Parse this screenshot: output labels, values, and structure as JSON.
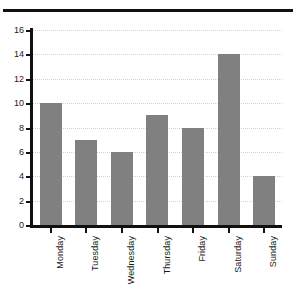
{
  "chart_data": {
    "type": "bar",
    "title": "",
    "title_note": "title row is cropped off the top edge of the screenshot and is not legible",
    "categories": [
      "Monday",
      "Tuesday",
      "Wednesday",
      "Thursday",
      "Friday",
      "Saturday",
      "Sunday"
    ],
    "values": [
      10,
      7,
      6,
      9,
      8,
      14,
      4
    ],
    "xlabel": "",
    "ylabel": "",
    "ylim": [
      0,
      16
    ],
    "ytick_labels": [
      "0",
      "2",
      "4",
      "6",
      "8",
      "10",
      "12",
      "14",
      "16"
    ],
    "ytick_values": [
      0,
      2,
      4,
      6,
      8,
      10,
      12,
      14,
      16
    ],
    "grid": true,
    "grid_axis": "y",
    "grid_style": "dotted",
    "legend": false,
    "legend_position": "none",
    "xtick_label_rotation": 90,
    "colors": {
      "bar": "#808080",
      "axis": "#111111",
      "gridline": "#d2d2d2",
      "background": "#ffffff",
      "text": "#1a1a1a"
    }
  }
}
